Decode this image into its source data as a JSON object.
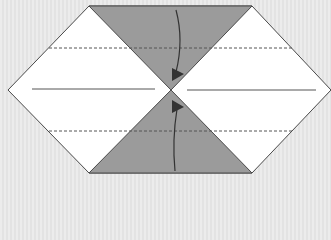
{
  "diagram": {
    "type": "origami-fold-step",
    "colors": {
      "background": "#e9e9e9",
      "paper": "#ffffff",
      "shaded": "#9b9b9b",
      "edge": "#4a4a4a",
      "arrow": "#333333",
      "crease": "#555555"
    },
    "shape": {
      "hexagon_points": [
        [
          89,
          6
        ],
        [
          252,
          6
        ],
        [
          331,
          90
        ],
        [
          252,
          173
        ],
        [
          89,
          173
        ],
        [
          8,
          90
        ]
      ],
      "center": [
        171,
        90
      ],
      "top_triangle": [
        [
          89,
          6
        ],
        [
          252,
          6
        ],
        [
          171,
          90
        ]
      ],
      "bottom_triangle": [
        [
          89,
          173
        ],
        [
          252,
          173
        ],
        [
          171,
          90
        ]
      ]
    },
    "lines": {
      "valley_fold_upper": {
        "style": "dashed",
        "y": 48,
        "x1": 49,
        "x2": 292
      },
      "valley_fold_lower": {
        "style": "dashed",
        "y": 131,
        "x1": 49,
        "x2": 292
      },
      "crease_left": {
        "style": "solid",
        "y": 89,
        "x1": 32,
        "x2": 155
      },
      "crease_right": {
        "style": "solid",
        "y": 90,
        "x1": 187,
        "x2": 316
      }
    },
    "arrows": [
      {
        "name": "fold-down-arrow",
        "direction": "down",
        "from": [
          176,
          10
        ],
        "to": [
          172,
          80
        ]
      },
      {
        "name": "fold-up-arrow",
        "direction": "up",
        "from": [
          175,
          171
        ],
        "to": [
          172,
          101
        ]
      }
    ]
  }
}
